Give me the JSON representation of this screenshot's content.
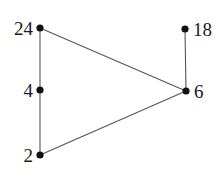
{
  "figure": {
    "title": "",
    "background_color": "#ffffff",
    "width": 221,
    "height": 177
  },
  "chart_data": {
    "type": "diagram",
    "subtype": "node-link-graph",
    "title": "",
    "xlabel": "",
    "ylabel": "",
    "grid": false,
    "legend": null,
    "node_color": "#111111",
    "edge_color": "#555555",
    "label_color": "#1a1a1a",
    "node_radius_px": 3.6,
    "edge_width_px": 1.1,
    "nodes": [
      {
        "id": "n24",
        "label": "24",
        "x": 40,
        "y": 28,
        "label_x": 33,
        "label_y": 28,
        "label_side": "left"
      },
      {
        "id": "n4",
        "label": "4",
        "x": 40,
        "y": 90,
        "label_x": 33,
        "label_y": 90,
        "label_side": "left"
      },
      {
        "id": "n2",
        "label": "2",
        "x": 40,
        "y": 155,
        "label_x": 33,
        "label_y": 155,
        "label_side": "left"
      },
      {
        "id": "n18",
        "label": "18",
        "x": 185,
        "y": 29,
        "label_x": 193,
        "label_y": 29,
        "label_side": "right"
      },
      {
        "id": "n6",
        "label": "6",
        "x": 186,
        "y": 91,
        "label_x": 194,
        "label_y": 91,
        "label_side": "right"
      }
    ],
    "edges": [
      {
        "id": "e1",
        "source": "n24",
        "target": "n4"
      },
      {
        "id": "e2",
        "source": "n4",
        "target": "n2"
      },
      {
        "id": "e3",
        "source": "n24",
        "target": "n6"
      },
      {
        "id": "e4",
        "source": "n2",
        "target": "n6"
      },
      {
        "id": "e5",
        "source": "n18",
        "target": "n6"
      }
    ]
  }
}
